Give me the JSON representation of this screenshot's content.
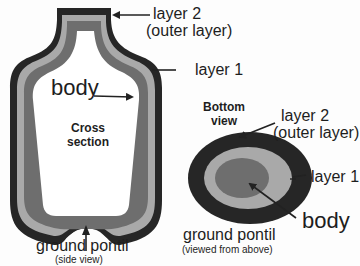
{
  "diagram": {
    "colors": {
      "outer_layer": "#262626",
      "layer1": "#a9a9a9",
      "body_dark": "#6e6e6e",
      "body_interior": "#ffffff",
      "text": "#1e1e1e"
    },
    "side_view": {
      "labels": {
        "layer2_line1": "layer 2",
        "layer2_line2": "(outer layer)",
        "layer1": "layer 1",
        "body": "body",
        "cross_line1": "Cross",
        "cross_line2": "section",
        "pontil": "ground pontil",
        "pontil_sub": "(side view)"
      }
    },
    "bottom_view": {
      "labels": {
        "title_line1": "Bottom",
        "title_line2": "view",
        "layer2_line1": "layer 2",
        "layer2_line2": "(outer layer)",
        "layer1": "layer 1",
        "body": "body",
        "pontil": "ground pontil",
        "pontil_sub": "(viewed from above)"
      }
    }
  }
}
